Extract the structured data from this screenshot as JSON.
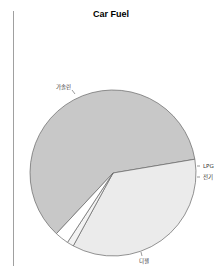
{
  "chart_data": {
    "type": "pie",
    "title": "Car Fuel",
    "categories": [
      "가솔린",
      "디젤",
      "전기",
      "LPG"
    ],
    "values": [
      60.4,
      35.6,
      1.3,
      2.7
    ],
    "colors": [
      "#c8c8c8",
      "#ebebeb",
      "#f3f3f3",
      "#ffffff"
    ],
    "start_angle_deg": 133,
    "direction": "clockwise",
    "legend": "none",
    "labels_outside": true
  },
  "labels": {
    "gasoline": "가솔린",
    "diesel": "디젤",
    "electric": "전기",
    "lpg": "LPG"
  }
}
